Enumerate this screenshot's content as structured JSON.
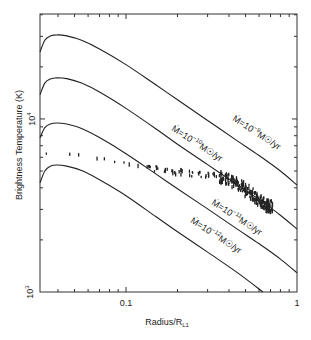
{
  "chart_data": {
    "type": "line",
    "title": "",
    "xlabel": "Radius/R_L1",
    "xlabel_main": "Radius/R",
    "xlabel_sub": "L1",
    "ylabel": "Brightness Temperature (K)",
    "xscale": "log",
    "yscale": "log",
    "xlim": [
      0.0314,
      1
    ],
    "ylim": [
      1000,
      40400
    ],
    "x_ticks": [
      {
        "value": 0.1,
        "label": "0.1"
      },
      {
        "value": 1,
        "label": "1"
      }
    ],
    "y_ticks": [
      {
        "value": 1000,
        "label_base": "10",
        "label_exp": "3"
      },
      {
        "value": 10000,
        "label_base": "10",
        "label_exp": "4"
      }
    ],
    "grid": false,
    "legend": "none (inline curve labels)",
    "series": [
      {
        "name": "Ṁ=10⁻⁹ M☉/yr",
        "label_base": "Ṁ=10",
        "label_exp": "−9",
        "label_tail": "M☉/yr",
        "kind": "line",
        "x": [
          0.0314,
          0.0335,
          0.036,
          0.0395,
          0.045,
          0.055,
          0.07,
          0.1,
          0.15,
          0.2,
          0.3,
          0.45,
          0.6,
          0.8,
          1.0
        ],
        "y": [
          24400,
          28500,
          30100,
          30600,
          30200,
          28500,
          25400,
          20600,
          15700,
          12900,
          9800,
          7450,
          6150,
          5000,
          4150
        ]
      },
      {
        "name": "Ṁ=10⁻¹⁰ M☉/yr",
        "label_base": "Ṁ=10",
        "label_exp": "−10",
        "label_tail": "M☉/yr",
        "kind": "line",
        "x": [
          0.0314,
          0.0335,
          0.036,
          0.0395,
          0.045,
          0.055,
          0.07,
          0.1,
          0.15,
          0.2,
          0.3,
          0.45,
          0.6,
          0.8,
          1.0
        ],
        "y": [
          13800,
          16100,
          17000,
          17300,
          17100,
          16100,
          14300,
          11500,
          8750,
          7150,
          5450,
          4150,
          3420,
          2780,
          2310
        ]
      },
      {
        "name": "Ṁ=10⁻¹¹ M☉/yr",
        "label_base": "Ṁ=10",
        "label_exp": "−11",
        "label_tail": "M☉/yr",
        "kind": "line",
        "x": [
          0.0314,
          0.0335,
          0.036,
          0.0395,
          0.045,
          0.055,
          0.07,
          0.1,
          0.15,
          0.2,
          0.3,
          0.45,
          0.6,
          0.8,
          1.0
        ],
        "y": [
          7760,
          8900,
          9350,
          9480,
          9350,
          8800,
          7800,
          6300,
          4800,
          3950,
          3020,
          2300,
          1900,
          1550,
          1290
        ]
      },
      {
        "name": "Ṁ=10⁻¹² M☉/yr",
        "label_base": "Ṁ=10",
        "label_exp": "−12",
        "label_tail": "M☉/yr",
        "kind": "line",
        "x": [
          0.0314,
          0.0335,
          0.036,
          0.0395,
          0.045,
          0.055,
          0.07,
          0.1,
          0.15,
          0.2,
          0.3,
          0.45,
          0.632
        ],
        "y": [
          4270,
          5000,
          5330,
          5420,
          5340,
          5030,
          4450,
          3600,
          2720,
          2230,
          1700,
          1290,
          1000
        ]
      },
      {
        "name": "observed",
        "kind": "scatter",
        "x": [
          0.0342,
          0.0475,
          0.054,
          0.068,
          0.074,
          0.087,
          0.097,
          0.107,
          0.12,
          0.135,
          0.15,
          0.17,
          0.19,
          0.21,
          0.24,
          0.27,
          0.3,
          0.33,
          0.36,
          0.39,
          0.42,
          0.45,
          0.48,
          0.51,
          0.54,
          0.57,
          0.6,
          0.63,
          0.66,
          0.68,
          0.7
        ],
        "y": [
          6300,
          6250,
          6200,
          5900,
          5880,
          5650,
          5600,
          5450,
          5350,
          5250,
          5150,
          5050,
          4950,
          4900,
          4800,
          4750,
          4700,
          4650,
          4600,
          4500,
          4350,
          4200,
          4050,
          3850,
          3650,
          3500,
          3350,
          3250,
          3150,
          3120,
          3100
        ]
      }
    ],
    "annotations": [
      {
        "text": "Ṁ=10⁻⁹ M☉/yr",
        "near_series": 0
      },
      {
        "text": "Ṁ=10⁻¹⁰ M☉/yr",
        "near_series": 1
      },
      {
        "text": "Ṁ=10⁻¹¹ M☉/yr",
        "near_series": 2
      },
      {
        "text": "Ṁ=10⁻¹² M☉/yr",
        "near_series": 3
      }
    ]
  }
}
